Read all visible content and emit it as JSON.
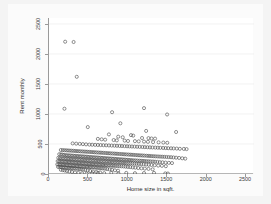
{
  "chart_data": {
    "type": "scatter",
    "title": "",
    "xlabel": "Home size in sqft.",
    "ylabel": "Rent monthly",
    "xlim": [
      0,
      2600
    ],
    "ylim": [
      0,
      2600
    ],
    "xticks": [
      0,
      500,
      1000,
      1500,
      2000,
      2500
    ],
    "yticks": [
      0,
      500,
      1000,
      1500,
      2000,
      2500
    ],
    "xtick_labels": [
      "0",
      "500",
      "1000",
      "1500",
      "2000",
      "2500"
    ],
    "ytick_labels": [
      "0",
      "500",
      "1000",
      "1500",
      "2000",
      "2500"
    ],
    "grid": "horizontal",
    "legend": "none",
    "marker": "open-circle",
    "marker_color": "#4a4a4a",
    "n_points": 420,
    "points": [
      [
        205,
        2205
      ],
      [
        312,
        2200
      ],
      [
        352,
        1620
      ],
      [
        196,
        1088
      ],
      [
        1205,
        1098
      ],
      [
        800,
        1030
      ],
      [
        1498,
        992
      ],
      [
        905,
        845
      ],
      [
        492,
        782
      ],
      [
        1232,
        718
      ],
      [
        1612,
        700
      ],
      [
        760,
        660
      ],
      [
        1040,
        648
      ],
      [
        1068,
        640
      ],
      [
        878,
        622
      ],
      [
        935,
        612
      ],
      [
        1180,
        600
      ],
      [
        1262,
        598
      ],
      [
        1300,
        592
      ],
      [
        1345,
        590
      ],
      [
        620,
        585
      ],
      [
        668,
        578
      ],
      [
        712,
        572
      ],
      [
        820,
        566
      ],
      [
        860,
        560
      ],
      [
        960,
        556
      ],
      [
        1002,
        550
      ],
      [
        1090,
        548
      ],
      [
        1138,
        544
      ],
      [
        1205,
        540
      ],
      [
        1255,
        536
      ],
      [
        1320,
        532
      ],
      [
        1390,
        528
      ],
      [
        1450,
        524
      ],
      [
        1500,
        520
      ],
      [
        300,
        510
      ],
      [
        345,
        506
      ],
      [
        390,
        502
      ],
      [
        430,
        498
      ],
      [
        470,
        494
      ],
      [
        512,
        490
      ],
      [
        548,
        488
      ],
      [
        585,
        486
      ],
      [
        620,
        484
      ],
      [
        655,
        482
      ],
      [
        690,
        480
      ],
      [
        725,
        478
      ],
      [
        760,
        476
      ],
      [
        795,
        474
      ],
      [
        830,
        472
      ],
      [
        862,
        470
      ],
      [
        895,
        468
      ],
      [
        925,
        466
      ],
      [
        958,
        464
      ],
      [
        990,
        462
      ],
      [
        1020,
        460
      ],
      [
        1052,
        458
      ],
      [
        1085,
        456
      ],
      [
        1118,
        454
      ],
      [
        1150,
        452
      ],
      [
        1185,
        450
      ],
      [
        1215,
        448
      ],
      [
        1248,
        446
      ],
      [
        1280,
        444
      ],
      [
        1312,
        442
      ],
      [
        1348,
        440
      ],
      [
        1380,
        438
      ],
      [
        1412,
        436
      ],
      [
        1448,
        434
      ],
      [
        1480,
        432
      ],
      [
        1512,
        430
      ],
      [
        1548,
        428
      ],
      [
        1580,
        426
      ],
      [
        1620,
        424
      ],
      [
        1660,
        420
      ],
      [
        1710,
        418
      ],
      [
        1745,
        415
      ],
      [
        150,
        400
      ],
      [
        175,
        398
      ],
      [
        198,
        396
      ],
      [
        220,
        394
      ],
      [
        242,
        392
      ],
      [
        265,
        390
      ],
      [
        288,
        388
      ],
      [
        310,
        386
      ],
      [
        332,
        384
      ],
      [
        355,
        382
      ],
      [
        378,
        380
      ],
      [
        400,
        378
      ],
      [
        422,
        376
      ],
      [
        445,
        374
      ],
      [
        468,
        372
      ],
      [
        490,
        370
      ],
      [
        512,
        368
      ],
      [
        535,
        366
      ],
      [
        558,
        364
      ],
      [
        580,
        362
      ],
      [
        602,
        360
      ],
      [
        625,
        358
      ],
      [
        648,
        356
      ],
      [
        670,
        354
      ],
      [
        692,
        352
      ],
      [
        715,
        350
      ],
      [
        738,
        348
      ],
      [
        760,
        346
      ],
      [
        782,
        344
      ],
      [
        805,
        342
      ],
      [
        828,
        340
      ],
      [
        850,
        338
      ],
      [
        872,
        336
      ],
      [
        895,
        334
      ],
      [
        918,
        332
      ],
      [
        940,
        330
      ],
      [
        962,
        328
      ],
      [
        985,
        326
      ],
      [
        1008,
        324
      ],
      [
        1030,
        322
      ],
      [
        1052,
        320
      ],
      [
        1075,
        318
      ],
      [
        1098,
        316
      ],
      [
        1120,
        314
      ],
      [
        1142,
        312
      ],
      [
        1165,
        310
      ],
      [
        1188,
        308
      ],
      [
        1210,
        306
      ],
      [
        1235,
        304
      ],
      [
        1258,
        302
      ],
      [
        1280,
        300
      ],
      [
        1305,
        298
      ],
      [
        1330,
        296
      ],
      [
        1355,
        294
      ],
      [
        1382,
        292
      ],
      [
        1408,
        290
      ],
      [
        1435,
        288
      ],
      [
        1462,
        286
      ],
      [
        1490,
        284
      ],
      [
        1518,
        282
      ],
      [
        1548,
        280
      ],
      [
        1578,
        276
      ],
      [
        1612,
        272
      ],
      [
        1650,
        268
      ],
      [
        1690,
        262
      ],
      [
        1728,
        256
      ],
      [
        130,
        330
      ],
      [
        152,
        326
      ],
      [
        172,
        322
      ],
      [
        192,
        318
      ],
      [
        212,
        314
      ],
      [
        232,
        312
      ],
      [
        252,
        310
      ],
      [
        272,
        308
      ],
      [
        292,
        306
      ],
      [
        312,
        304
      ],
      [
        332,
        302
      ],
      [
        352,
        300
      ],
      [
        372,
        298
      ],
      [
        392,
        296
      ],
      [
        412,
        294
      ],
      [
        432,
        292
      ],
      [
        452,
        290
      ],
      [
        472,
        288
      ],
      [
        492,
        286
      ],
      [
        512,
        284
      ],
      [
        532,
        282
      ],
      [
        552,
        280
      ],
      [
        572,
        278
      ],
      [
        592,
        276
      ],
      [
        612,
        274
      ],
      [
        632,
        272
      ],
      [
        652,
        270
      ],
      [
        672,
        268
      ],
      [
        692,
        266
      ],
      [
        712,
        264
      ],
      [
        732,
        262
      ],
      [
        752,
        260
      ],
      [
        772,
        258
      ],
      [
        792,
        256
      ],
      [
        812,
        254
      ],
      [
        832,
        252
      ],
      [
        852,
        250
      ],
      [
        872,
        248
      ],
      [
        892,
        246
      ],
      [
        912,
        244
      ],
      [
        932,
        242
      ],
      [
        952,
        240
      ],
      [
        972,
        238
      ],
      [
        992,
        236
      ],
      [
        1012,
        234
      ],
      [
        1032,
        232
      ],
      [
        1052,
        230
      ],
      [
        1075,
        228
      ],
      [
        1098,
        226
      ],
      [
        1120,
        224
      ],
      [
        1145,
        222
      ],
      [
        1168,
        220
      ],
      [
        1192,
        218
      ],
      [
        1215,
        216
      ],
      [
        1240,
        214
      ],
      [
        1265,
        212
      ],
      [
        1290,
        210
      ],
      [
        1318,
        208
      ],
      [
        1345,
        205
      ],
      [
        1375,
        202
      ],
      [
        1405,
        198
      ],
      [
        1440,
        195
      ],
      [
        1478,
        190
      ],
      [
        1520,
        186
      ],
      [
        1560,
        182
      ],
      [
        118,
        270
      ],
      [
        138,
        266
      ],
      [
        158,
        262
      ],
      [
        178,
        260
      ],
      [
        198,
        258
      ],
      [
        218,
        256
      ],
      [
        238,
        254
      ],
      [
        258,
        252
      ],
      [
        278,
        250
      ],
      [
        298,
        248
      ],
      [
        318,
        246
      ],
      [
        338,
        244
      ],
      [
        358,
        242
      ],
      [
        378,
        240
      ],
      [
        398,
        238
      ],
      [
        418,
        236
      ],
      [
        438,
        234
      ],
      [
        458,
        232
      ],
      [
        478,
        230
      ],
      [
        498,
        228
      ],
      [
        518,
        226
      ],
      [
        538,
        224
      ],
      [
        558,
        222
      ],
      [
        578,
        220
      ],
      [
        598,
        218
      ],
      [
        618,
        216
      ],
      [
        638,
        214
      ],
      [
        658,
        212
      ],
      [
        678,
        210
      ],
      [
        698,
        208
      ],
      [
        718,
        206
      ],
      [
        738,
        204
      ],
      [
        758,
        202
      ],
      [
        778,
        200
      ],
      [
        798,
        198
      ],
      [
        818,
        196
      ],
      [
        838,
        194
      ],
      [
        858,
        192
      ],
      [
        878,
        190
      ],
      [
        898,
        188
      ],
      [
        918,
        186
      ],
      [
        940,
        184
      ],
      [
        962,
        182
      ],
      [
        985,
        180
      ],
      [
        1008,
        178
      ],
      [
        1032,
        176
      ],
      [
        1058,
        174
      ],
      [
        1085,
        172
      ],
      [
        1112,
        170
      ],
      [
        1140,
        168
      ],
      [
        1170,
        165
      ],
      [
        1200,
        162
      ],
      [
        1232,
        158
      ],
      [
        1265,
        155
      ],
      [
        1300,
        150
      ],
      [
        1340,
        146
      ],
      [
        1385,
        140
      ],
      [
        1432,
        136
      ],
      [
        1482,
        130
      ],
      [
        110,
        215
      ],
      [
        128,
        212
      ],
      [
        146,
        210
      ],
      [
        164,
        208
      ],
      [
        182,
        206
      ],
      [
        200,
        204
      ],
      [
        218,
        202
      ],
      [
        236,
        200
      ],
      [
        254,
        198
      ],
      [
        272,
        196
      ],
      [
        290,
        194
      ],
      [
        308,
        192
      ],
      [
        326,
        190
      ],
      [
        344,
        188
      ],
      [
        362,
        186
      ],
      [
        380,
        184
      ],
      [
        398,
        182
      ],
      [
        416,
        180
      ],
      [
        434,
        178
      ],
      [
        452,
        176
      ],
      [
        470,
        174
      ],
      [
        488,
        172
      ],
      [
        506,
        170
      ],
      [
        524,
        168
      ],
      [
        542,
        166
      ],
      [
        560,
        164
      ],
      [
        578,
        162
      ],
      [
        596,
        160
      ],
      [
        614,
        158
      ],
      [
        632,
        156
      ],
      [
        650,
        154
      ],
      [
        668,
        152
      ],
      [
        686,
        150
      ],
      [
        704,
        148
      ],
      [
        722,
        146
      ],
      [
        742,
        144
      ],
      [
        762,
        142
      ],
      [
        782,
        140
      ],
      [
        802,
        138
      ],
      [
        822,
        136
      ],
      [
        845,
        134
      ],
      [
        868,
        132
      ],
      [
        892,
        130
      ],
      [
        918,
        128
      ],
      [
        945,
        126
      ],
      [
        972,
        122
      ],
      [
        1000,
        118
      ],
      [
        1030,
        115
      ],
      [
        1062,
        110
      ],
      [
        1095,
        106
      ],
      [
        1132,
        100
      ],
      [
        1172,
        95
      ],
      [
        1215,
        90
      ],
      [
        1262,
        85
      ],
      [
        1315,
        78
      ],
      [
        105,
        160
      ],
      [
        122,
        158
      ],
      [
        140,
        156
      ],
      [
        158,
        154
      ],
      [
        176,
        152
      ],
      [
        194,
        150
      ],
      [
        212,
        148
      ],
      [
        230,
        146
      ],
      [
        248,
        144
      ],
      [
        266,
        142
      ],
      [
        284,
        140
      ],
      [
        302,
        138
      ],
      [
        320,
        136
      ],
      [
        338,
        134
      ],
      [
        356,
        132
      ],
      [
        374,
        130
      ],
      [
        392,
        128
      ],
      [
        410,
        126
      ],
      [
        428,
        124
      ],
      [
        446,
        122
      ],
      [
        464,
        120
      ],
      [
        482,
        118
      ],
      [
        500,
        116
      ],
      [
        518,
        114
      ],
      [
        536,
        112
      ],
      [
        556,
        110
      ],
      [
        576,
        108
      ],
      [
        596,
        105
      ],
      [
        616,
        102
      ],
      [
        638,
        100
      ],
      [
        660,
        96
      ],
      [
        684,
        92
      ],
      [
        710,
        88
      ],
      [
        738,
        82
      ],
      [
        768,
        76
      ],
      [
        800,
        70
      ],
      [
        836,
        62
      ],
      [
        876,
        55
      ],
      [
        115,
        118
      ],
      [
        135,
        115
      ],
      [
        155,
        112
      ],
      [
        175,
        110
      ],
      [
        195,
        108
      ],
      [
        215,
        105
      ],
      [
        235,
        102
      ],
      [
        255,
        100
      ],
      [
        275,
        98
      ],
      [
        295,
        95
      ],
      [
        315,
        92
      ],
      [
        335,
        90
      ],
      [
        358,
        86
      ],
      [
        382,
        82
      ],
      [
        406,
        78
      ],
      [
        432,
        72
      ],
      [
        460,
        66
      ],
      [
        490,
        58
      ],
      [
        522,
        50
      ],
      [
        558,
        42
      ],
      [
        600,
        34
      ],
      [
        648,
        26
      ],
      [
        150,
        70
      ],
      [
        175,
        64
      ],
      [
        200,
        58
      ],
      [
        228,
        50
      ],
      [
        258,
        42
      ],
      [
        292,
        34
      ],
      [
        330,
        26
      ],
      [
        372,
        18
      ],
      [
        420,
        12
      ],
      [
        478,
        8
      ],
      [
        548,
        14
      ],
      [
        620,
        20
      ],
      [
        700,
        14
      ],
      [
        790,
        18
      ],
      [
        880,
        12
      ],
      [
        980,
        18
      ],
      [
        1090,
        14
      ],
      [
        1205,
        16
      ],
      [
        1332,
        18
      ],
      [
        1475,
        10
      ],
      [
        1508,
        8
      ]
    ]
  },
  "axes": {
    "x_title": "Home size in sqft.",
    "y_title": "Rent monthly",
    "x_tick_labels": [
      "0",
      "500",
      "1000",
      "1500",
      "2000",
      "2500"
    ],
    "y_tick_labels": [
      "0",
      "500",
      "1000",
      "1500",
      "2000",
      "2500"
    ]
  },
  "colors": {
    "marker_stroke": "#4a4a4a",
    "plot_background": "#ffffff",
    "figure_background": "#f4f4f4",
    "axis_line": "#9a9a9a",
    "gridline": "#ececec",
    "text": "#333333"
  }
}
